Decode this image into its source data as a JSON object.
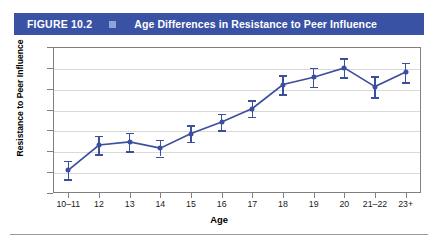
{
  "header": {
    "figure_number": "FIGURE 10.2",
    "separator_icon": "square-bullet-icon",
    "title": "Age Differences in Resistance to Peer Influence",
    "bar_color": "#3a52a4",
    "square_color": "#8fa4d4"
  },
  "chart_data": {
    "type": "line",
    "title": "Age Differences in Resistance to Peer Influence",
    "xlabel": "Age",
    "ylabel": "Resistance to Peer Influence",
    "categories": [
      "10–11",
      "12",
      "13",
      "14",
      "15",
      "16",
      "17",
      "18",
      "19",
      "20",
      "21–22",
      "23+"
    ],
    "values": [
      2.81,
      2.93,
      2.945,
      2.915,
      2.985,
      3.04,
      3.105,
      3.22,
      3.255,
      3.3,
      3.21,
      3.28
    ],
    "error_low": [
      2.765,
      2.885,
      2.9,
      2.875,
      2.945,
      3.0,
      3.065,
      3.175,
      3.21,
      3.255,
      3.16,
      3.23
    ],
    "error_high": [
      2.855,
      2.975,
      2.99,
      2.955,
      3.025,
      3.08,
      3.145,
      3.265,
      3.3,
      3.345,
      3.26,
      3.325
    ],
    "ylim": [
      2.7,
      3.4
    ],
    "ytick_labels": [
      "3.40",
      "3.30",
      "3.20",
      "3.10",
      "3.00",
      "2.90",
      "2.80",
      "2.70"
    ],
    "ytick_values": [
      3.4,
      3.3,
      3.2,
      3.1,
      3.0,
      2.9,
      2.8,
      2.7
    ],
    "grid": true,
    "legend": "none",
    "series_color": "#3c4f9e",
    "grid_color": "#d9d9d9",
    "axis_color": "#808080"
  }
}
